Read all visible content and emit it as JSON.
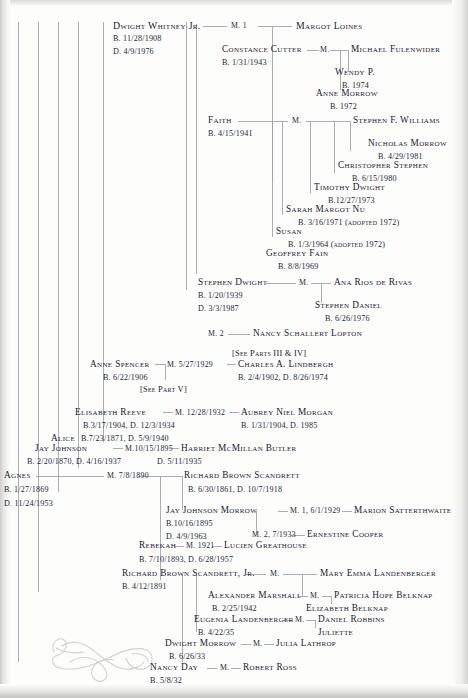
{
  "document": {
    "type": "genealogy-chart",
    "family": "Morrow / Scandrett / Lindbergh descendants",
    "background_color": "#fdfdfb",
    "rule_color": "#9aa0ae",
    "text_color": "#1b2034"
  },
  "cross_references": {
    "lindbergh_ref": "[See Parts III & IV]",
    "anne_spencer_ref": "[See Part V]"
  },
  "entries": [
    {
      "id": "dwight_whitney_jr",
      "name": "Dwight Whitney Jr.",
      "born": "B. 11/28/1908",
      "died": "D. 4/9/1976"
    },
    {
      "id": "margot_loines",
      "name": "Margot Loines",
      "marriage": "M. 1"
    },
    {
      "id": "constance_cutter",
      "name": "Constance Cutter",
      "born": "B. 1/31/1943",
      "marriage": "M."
    },
    {
      "id": "michael_fulenwider",
      "name": "Michael Fulenwider"
    },
    {
      "id": "wendy_p",
      "name": "Wendy P.",
      "born": "B. 1974"
    },
    {
      "id": "anne_morrow_fulenwider",
      "name": "Anne Morrow",
      "born": "B. 1972"
    },
    {
      "id": "faith",
      "name": "Faith",
      "born": "B. 4/15/1941",
      "marriage": "M."
    },
    {
      "id": "stephen_f_williams",
      "name": "Stephen F. Williams"
    },
    {
      "id": "nicholas_morrow",
      "name": "Nicholas Morrow",
      "born": "B. 4/29/1981"
    },
    {
      "id": "christopher_stephen",
      "name": "Christopher Stephen",
      "born": "B. 6/15/1980"
    },
    {
      "id": "timothy_dwight",
      "name": "Timothy Dwight",
      "born": "B.12/27/1973"
    },
    {
      "id": "sarah_margot_nu",
      "name": "Sarah Margot Nu",
      "born": "B. 3/16/1971 (adopted 1972)"
    },
    {
      "id": "susan",
      "name": "Susan",
      "born": "B. 1/3/1964 (adopted 1972)"
    },
    {
      "id": "geoffrey_fain",
      "name": "Geoffrey Fain",
      "born": "B. 8/8/1969"
    },
    {
      "id": "stephen_dwight",
      "name": "Stephen Dwight",
      "born": "B. 1/20/1939",
      "died": "D. 3/3/1987",
      "marriage": "M."
    },
    {
      "id": "ana_rios_de_rivas",
      "name": "Ana Rios de Rivas"
    },
    {
      "id": "stephen_daniel",
      "name": "Stephen Daniel",
      "born": "B. 6/26/1976"
    },
    {
      "id": "nancy_schallert_lopton",
      "name": "Nancy Schallert Lopton",
      "marriage": "M. 2"
    },
    {
      "id": "anne_spencer",
      "name": "Anne Spencer",
      "born": "B. 6/22/1906",
      "marriage": "M. 5/27/1929"
    },
    {
      "id": "charles_a_lindbergh",
      "name": "Charles A. Lindbergh",
      "born": "B. 2/4/1902, D. 8/26/1974"
    },
    {
      "id": "elisabeth_reeve",
      "name": "Elisabeth Reeve",
      "born": "B.3/17/1904, D. 12/3/1934",
      "marriage": "M. 12/28/1932"
    },
    {
      "id": "aubrey_niel_morgan",
      "name": "Aubrey Niel Morgan",
      "born": "B. 1/31/1904, D. 1985"
    },
    {
      "id": "alice",
      "name": "Alice",
      "born": "B.7/23/1871, D. 5/9/1940"
    },
    {
      "id": "jay_johnson",
      "name": "Jay Johnson",
      "born": "B. 2/20/1870, D. 4/16/1937",
      "marriage": "M.10/15/1895"
    },
    {
      "id": "harriet_mcmillan_butler",
      "name": "Harriet McMillan Butler",
      "died": "D. 5/11/1935"
    },
    {
      "id": "agnes",
      "name": "Agnes",
      "born": "B. 1/27/1869",
      "died": "D. 11/24/1953",
      "marriage": "M. 7/8/1890"
    },
    {
      "id": "richard_brown_scandrett",
      "name": "Richard Brown Scandrett",
      "born": "B. 6/30/1861, D. 10/7/1918"
    },
    {
      "id": "jay_johnson_morrow",
      "name": "Jay Johnson Morrow",
      "born": "B.10/16/1895",
      "died": "D. 4/9/1963",
      "marriage": "M. 1, 6/1/1929",
      "marriage2": "M. 2, 7/1933"
    },
    {
      "id": "marion_satterthwaite",
      "name": "Marion Satterthwaite"
    },
    {
      "id": "ernestine_cooper",
      "name": "Ernestine Cooper"
    },
    {
      "id": "rebekah",
      "name": "Rebekah",
      "born": "B. 7/10/1893, D. 6/28/1957",
      "marriage": "M. 1921"
    },
    {
      "id": "lucien_greathouse",
      "name": "Lucien Greathouse"
    },
    {
      "id": "richard_brown_scandrett_jr",
      "name": "Richard Brown Scandrett, Jr.",
      "born": "B. 4/12/1891",
      "marriage": "M."
    },
    {
      "id": "mary_emma_landenberger",
      "name": "Mary Emma Landenberger"
    },
    {
      "id": "alexander_marshall",
      "name": "Alexander Marshall",
      "born": "B. 2/25/1942",
      "marriage": "M."
    },
    {
      "id": "patricia_hope_belknap",
      "name": "Patricia Hope Belknap"
    },
    {
      "id": "elizabeth_belknap",
      "name": "Elizabeth Belknap"
    },
    {
      "id": "eugenia_landenberger",
      "name": "Eugenia Landenberger",
      "born": "B. 4/22/35",
      "marriage": "M."
    },
    {
      "id": "daniel_robbins",
      "name": "Daniel Robbins"
    },
    {
      "id": "juliette",
      "name": "Juliette"
    },
    {
      "id": "dwight_morrow",
      "name": "Dwight Morrow",
      "born": "B. 6/26/33",
      "marriage": "M."
    },
    {
      "id": "julia_lathrop",
      "name": "Julia Lathrop"
    },
    {
      "id": "nancy_day",
      "name": "Nancy Day",
      "born": "B. 5/8/32",
      "marriage": "M."
    },
    {
      "id": "robert_ross",
      "name": "Robert Ross"
    }
  ]
}
